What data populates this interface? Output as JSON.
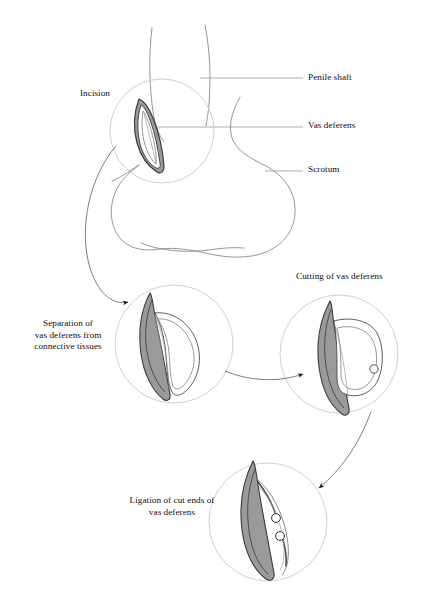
{
  "figure": {
    "background_color": "#ffffff"
  },
  "colors": {
    "outline": "#6e6e6e",
    "anatomy_outline": "#8a8a8a",
    "magnifier_circle": "#c9c9c9",
    "tissue_fill": "#9a9a9a",
    "tissue_outline": "#3a3a3a",
    "vas_fill": "#ffffff",
    "arrow": "#4a4a4a",
    "leader_line": "#999999",
    "text": "#0d0d0d"
  },
  "anatomy_labels": [
    {
      "id": "penile-shaft",
      "text": "Penile shaft"
    },
    {
      "id": "vas-deferens",
      "text": "Vas deferens"
    },
    {
      "id": "scrotum",
      "text": "Scrotum"
    }
  ],
  "step_labels": {
    "incision": "Incision",
    "separation": "Separation of\nvas deferens from\nconnective tissues",
    "cutting": "Cutting of vas deferens",
    "ligation": "Ligation of cut ends of\nvas deferens"
  },
  "steps": [
    {
      "order": 1,
      "name": "incision",
      "label": "Incision"
    },
    {
      "order": 2,
      "name": "separation",
      "label": "Separation of vas deferens from connective tissues"
    },
    {
      "order": 3,
      "name": "cutting",
      "label": "Cutting of vas deferens"
    },
    {
      "order": 4,
      "name": "ligation",
      "label": "Ligation of cut ends of vas deferens"
    }
  ]
}
